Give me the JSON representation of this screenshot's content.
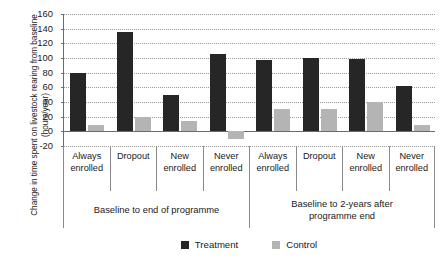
{
  "chart_data": {
    "type": "bar",
    "title": "",
    "xlabel": "",
    "ylabel": "Change in time spent on livestock rearing from baseline (hours/year)",
    "ylim": [
      -20,
      160
    ],
    "ytick_step": 20,
    "yticks": [
      160,
      140,
      120,
      100,
      80,
      60,
      40,
      20,
      0,
      -20
    ],
    "grid": true,
    "legend_position": "bottom-center",
    "categories": [
      "Always enrolled",
      "Dropout",
      "New enrolled",
      "Never enrolled",
      "Always enrolled",
      "Dropout",
      "New enrolled",
      "Never enrolled"
    ],
    "category_lines": [
      [
        "Always",
        "enrolled"
      ],
      [
        "Dropout",
        ""
      ],
      [
        "New",
        "enrolled"
      ],
      [
        "Never",
        "enrolled"
      ],
      [
        "Always",
        "enrolled"
      ],
      [
        "Dropout",
        ""
      ],
      [
        "New",
        "enrolled"
      ],
      [
        "Never",
        "enrolled"
      ]
    ],
    "groups": [
      {
        "label": "Baseline to end of programme",
        "label_lines": [
          "Baseline to end of programme",
          ""
        ],
        "span": 4
      },
      {
        "label": "Baseline to 2-years after programme end",
        "label_lines": [
          "Baseline to 2-years after",
          "programme end"
        ],
        "span": 4
      }
    ],
    "series": [
      {
        "name": "Treatment",
        "color": "#262626",
        "values": [
          80,
          136,
          50,
          105,
          97,
          100,
          98,
          62
        ]
      },
      {
        "name": "Control",
        "color": "#b4b4b4",
        "values": [
          8,
          20,
          14,
          -10,
          30,
          30,
          40,
          8
        ]
      }
    ]
  },
  "legend": {
    "items": [
      {
        "label": "Treatment",
        "color": "#262626"
      },
      {
        "label": "Control",
        "color": "#b4b4b4"
      }
    ]
  },
  "colors": {
    "treatment": "#262626",
    "control": "#b4b4b4",
    "axis": "#6b6b6b",
    "grid": "#9a9a9a",
    "text": "#1a1a1a",
    "background": "#ffffff"
  }
}
